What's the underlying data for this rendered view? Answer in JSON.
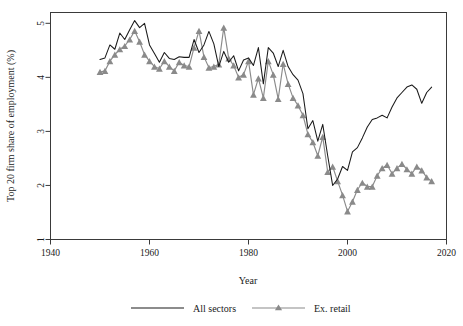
{
  "chart_data": {
    "type": "line",
    "title": "",
    "xlabel": "Year",
    "ylabel": "Top 20 firm share of employment (%)",
    "xlim": [
      1940,
      2020
    ],
    "ylim": [
      1,
      5.2
    ],
    "xticks": [
      1940,
      1960,
      1980,
      2000,
      2020
    ],
    "yticks": [
      1,
      2,
      3,
      4,
      5
    ],
    "xtick_labels": [
      "1940",
      "1960",
      "1980",
      "2000",
      "2020"
    ],
    "ytick_labels": [
      "1",
      "2",
      "3",
      "4",
      "5"
    ],
    "grid": false,
    "legend_position": "bottom",
    "colors": {
      "all_sectors": "#1a1a1a",
      "ex_retail": "#8a8a8a",
      "axis": "#3a3a3a",
      "background": "#ffffff"
    },
    "series": [
      {
        "name": "All sectors",
        "marker": "none",
        "color": "#1a1a1a",
        "x": [
          1950,
          1951,
          1952,
          1953,
          1954,
          1955,
          1956,
          1957,
          1958,
          1959,
          1960,
          1961,
          1962,
          1963,
          1964,
          1965,
          1966,
          1967,
          1968,
          1969,
          1970,
          1971,
          1972,
          1973,
          1974,
          1975,
          1976,
          1977,
          1978,
          1979,
          1980,
          1981,
          1982,
          1983,
          1984,
          1985,
          1986,
          1987,
          1988,
          1989,
          1990,
          1991,
          1992,
          1993,
          1994,
          1995,
          1996,
          1997,
          1998,
          1999,
          2000,
          2001,
          2002,
          2003,
          2004,
          2005,
          2006,
          2007,
          2008,
          2009,
          2010,
          2011,
          2012,
          2013,
          2014,
          2015,
          2016,
          2017
        ],
        "y": [
          4.33,
          4.36,
          4.6,
          4.52,
          4.82,
          4.7,
          4.88,
          5.05,
          4.92,
          5.0,
          4.6,
          4.44,
          4.28,
          4.46,
          4.35,
          4.33,
          4.38,
          4.37,
          4.37,
          4.7,
          4.46,
          4.6,
          4.85,
          4.62,
          4.2,
          4.48,
          4.28,
          4.4,
          4.12,
          4.32,
          4.36,
          4.22,
          4.55,
          3.88,
          4.55,
          4.45,
          4.2,
          4.5,
          4.2,
          4.05,
          3.95,
          3.7,
          3.05,
          3.2,
          2.82,
          3.13,
          2.55,
          2.0,
          2.12,
          2.35,
          2.28,
          2.62,
          2.7,
          2.88,
          3.08,
          3.22,
          3.25,
          3.3,
          3.25,
          3.45,
          3.62,
          3.72,
          3.82,
          3.86,
          3.78,
          3.52,
          3.72,
          3.82
        ]
      },
      {
        "name": "Ex. retail",
        "marker": "triangle",
        "color": "#8a8a8a",
        "x": [
          1950,
          1951,
          1952,
          1953,
          1954,
          1955,
          1956,
          1957,
          1958,
          1959,
          1960,
          1961,
          1962,
          1963,
          1964,
          1965,
          1966,
          1967,
          1968,
          1969,
          1970,
          1971,
          1972,
          1973,
          1974,
          1975,
          1976,
          1977,
          1978,
          1979,
          1980,
          1981,
          1982,
          1983,
          1984,
          1985,
          1986,
          1987,
          1988,
          1989,
          1990,
          1991,
          1992,
          1993,
          1994,
          1995,
          1996,
          1997,
          1998,
          1999,
          2000,
          2001,
          2002,
          2003,
          2004,
          2005,
          2006,
          2007,
          2008,
          2009,
          2010,
          2011,
          2012,
          2013,
          2014,
          2015,
          2016,
          2017
        ],
        "y": [
          4.1,
          4.12,
          4.3,
          4.42,
          4.52,
          4.58,
          4.7,
          4.86,
          4.66,
          4.42,
          4.3,
          4.2,
          4.16,
          4.3,
          4.2,
          4.12,
          4.28,
          4.22,
          4.2,
          4.55,
          4.86,
          4.38,
          4.18,
          4.2,
          4.24,
          4.92,
          4.35,
          4.22,
          4.0,
          4.05,
          4.3,
          3.68,
          3.98,
          3.62,
          4.3,
          4.05,
          3.6,
          4.25,
          3.88,
          3.62,
          3.48,
          3.3,
          2.95,
          2.8,
          2.55,
          2.9,
          2.25,
          2.35,
          2.08,
          1.82,
          1.52,
          1.7,
          1.92,
          2.05,
          1.98,
          1.98,
          2.18,
          2.32,
          2.38,
          2.22,
          2.32,
          2.4,
          2.3,
          2.22,
          2.35,
          2.28,
          2.15,
          2.08
        ]
      }
    ]
  },
  "legend": {
    "items": [
      {
        "label": "All sectors",
        "color": "#1a1a1a",
        "marker": "none"
      },
      {
        "label": "Ex. retail",
        "color": "#8a8a8a",
        "marker": "triangle"
      }
    ]
  }
}
